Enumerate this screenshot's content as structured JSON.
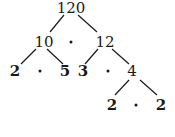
{
  "diagram": {
    "type": "factor-tree",
    "root": "120",
    "level1": {
      "left": "10",
      "right": "12"
    },
    "level2": {
      "a": "2",
      "b": "5",
      "c": "3",
      "d": "4"
    },
    "level3": {
      "a": "2",
      "b": "2"
    },
    "operator": "·",
    "edges": [
      [
        "120",
        "10"
      ],
      [
        "120",
        "12"
      ],
      [
        "10",
        "2"
      ],
      [
        "10",
        "5"
      ],
      [
        "12",
        "3"
      ],
      [
        "12",
        "4"
      ],
      [
        "4",
        "2"
      ],
      [
        "4",
        "2"
      ]
    ],
    "line_color": "#1a1a1a",
    "text_color": "#1a1a1a"
  }
}
